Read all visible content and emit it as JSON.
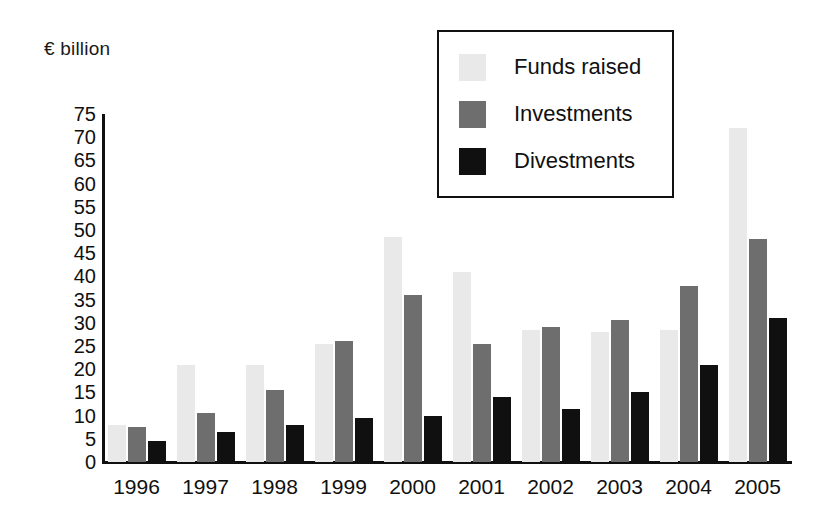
{
  "chart_data": {
    "type": "bar",
    "title": "",
    "subtitle": "",
    "xlabel": "",
    "ylabel": "€ billion",
    "unit_label": "€ billion",
    "categories": [
      "1996",
      "1997",
      "1998",
      "1999",
      "2000",
      "2001",
      "2002",
      "2003",
      "2004",
      "2005"
    ],
    "series": [
      {
        "name": "Funds raised",
        "color": "#e9e9e9",
        "values": [
          8,
          21,
          21,
          25.5,
          48.5,
          41,
          28.5,
          28,
          28.5,
          72
        ]
      },
      {
        "name": "Investments",
        "color": "#6e6e6e",
        "values": [
          7.5,
          10.5,
          15.5,
          26,
          36,
          25.5,
          29,
          30.5,
          38,
          48
        ]
      },
      {
        "name": "Divestments",
        "color": "#101010",
        "values": [
          4.5,
          6.5,
          8,
          9.5,
          10,
          14,
          11.5,
          15,
          21,
          31
        ]
      }
    ],
    "ylim": [
      0,
      75
    ],
    "ytick_step": 5,
    "yticks": [
      75,
      70,
      65,
      60,
      55,
      50,
      45,
      40,
      35,
      30,
      25,
      20,
      15,
      10,
      5,
      0
    ],
    "grid": false,
    "legend_position": "top-center",
    "legend_entries": [
      "Funds raised",
      "Investments",
      "Divestments"
    ]
  },
  "legend": {
    "items": [
      {
        "label": "Funds raised",
        "swatch": "#e9e9e9"
      },
      {
        "label": "Investments",
        "swatch": "#6e6e6e"
      },
      {
        "label": "Divestments",
        "swatch": "#101010"
      }
    ]
  },
  "colors": {
    "funds_raised": "#e9e9e9",
    "investments": "#6e6e6e",
    "divestments": "#101010",
    "axis": "#101010",
    "background": "#ffffff"
  }
}
